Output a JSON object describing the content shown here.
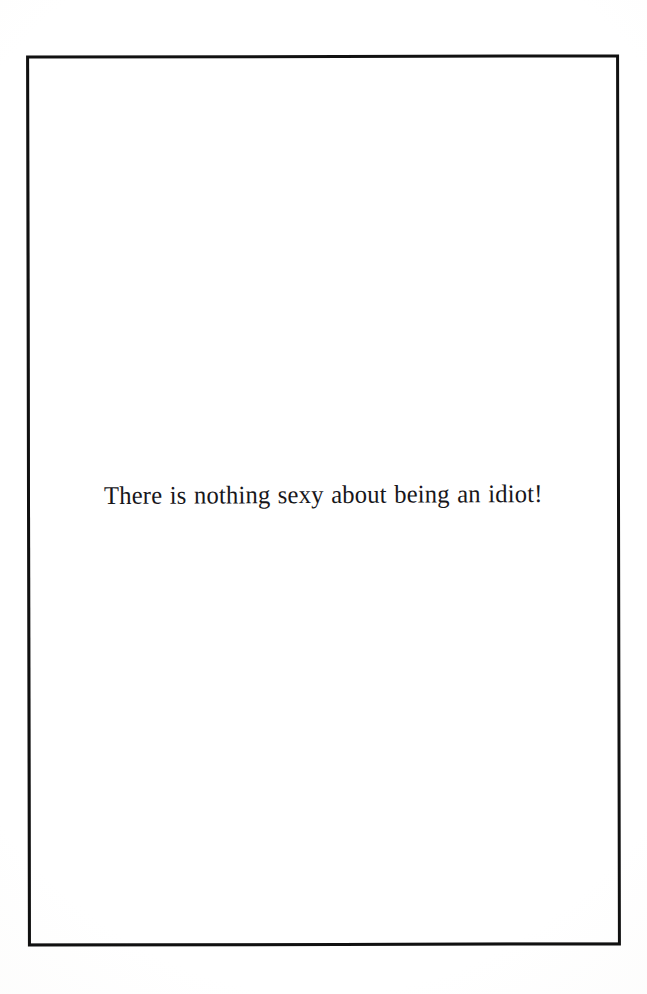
{
  "page": {
    "kind": "scanned-book-page",
    "background_color": "#ffffff",
    "width": 647,
    "height": 994
  },
  "frame": {
    "label": "rectangular ink border",
    "color": "#111111",
    "thickness_px": 3,
    "left": 27,
    "top": 55,
    "width": 593,
    "height": 891
  },
  "content": {
    "quote": "There is nothing sexy about being an idiot!",
    "text_color": "#17161a",
    "alignment": "center"
  }
}
